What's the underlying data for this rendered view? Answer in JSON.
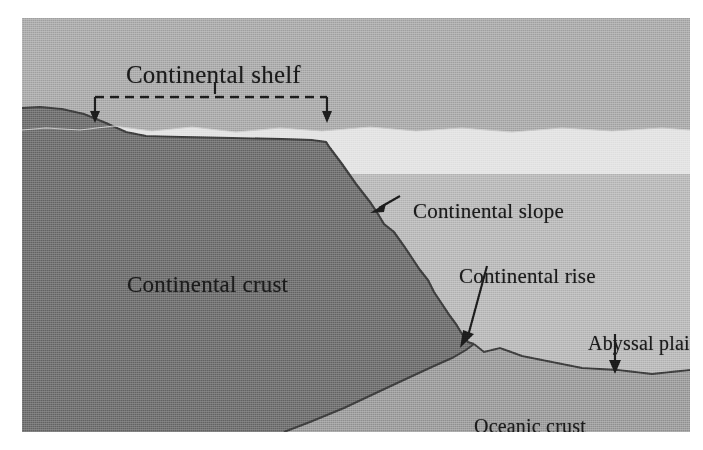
{
  "figure": {
    "kind": "cross-section-diagram",
    "frame": {
      "x": 22,
      "y": 18,
      "width": 668,
      "height": 414
    }
  },
  "labels": {
    "continental_shelf": "Continental shelf",
    "continental_slope": "Continental slope",
    "continental_rise": "Continental rise",
    "abyssal_plain": "Abyssal plain",
    "oceanic_crust": "Oceanic crust",
    "continental_crust": "Continental crust"
  },
  "annotations": {
    "shelf_bracket": {
      "style": "dashed",
      "left_arrow_x": 95,
      "right_arrow_x": 327,
      "line_y": 97,
      "tick_x": 215
    },
    "slope_arrow": {
      "from_x": 400,
      "from_y": 196,
      "to_x": 377,
      "to_y": 208
    },
    "rise_arrow": {
      "from_x": 487,
      "from_y": 266,
      "to_x": 466,
      "to_y": 345
    },
    "abyssal_arrow": {
      "from_x": 615,
      "from_y": 334,
      "to_x": 615,
      "to_y": 372
    }
  },
  "colors": {
    "upper_water": "#a9a9a9",
    "sediment_band": "#e2e2e2",
    "deep_water": "#b8b8b8",
    "continental_crust": "#6e6e6e",
    "oceanic_crust": "#9a9a9a",
    "outline": "#3b3b3b",
    "label_text": "#1b1b1b",
    "page_background": "#ffffff"
  }
}
